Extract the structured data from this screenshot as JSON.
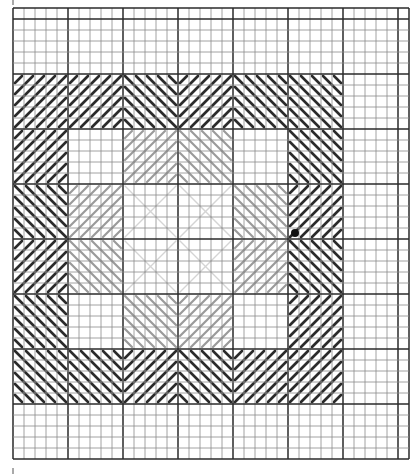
{
  "diagram": {
    "type": "needlepoint-stitch-chart",
    "grid": {
      "origin_x": 13,
      "origin_y": 8,
      "cell_size": 11,
      "cols": 36,
      "rows": 41,
      "major_every": 5,
      "major_col_offset": 0,
      "major_row_offset": 1,
      "minor_color": "#8a8a8a",
      "major_color": "#2a2a2a"
    },
    "blocks": {
      "origin_x": 13,
      "origin_y": 74,
      "block_size": 55,
      "rows": [
        [
          {
            "dir": "/",
            "tone": "dark"
          },
          {
            "dir": "/",
            "tone": "dark"
          },
          {
            "dir": "\\",
            "tone": "dark",
            "shape": "v-left"
          },
          {
            "dir": "/",
            "tone": "dark",
            "shape": "v-right"
          },
          {
            "dir": "\\",
            "tone": "dark"
          },
          {
            "dir": "\\",
            "tone": "dark"
          }
        ],
        [
          {
            "dir": "/",
            "tone": "dark"
          },
          {
            "dir": "none",
            "tone": "faint"
          },
          {
            "dir": "/",
            "tone": "light"
          },
          {
            "dir": "\\",
            "tone": "light"
          },
          {
            "dir": "none",
            "tone": "faint"
          },
          {
            "dir": "\\",
            "tone": "dark"
          }
        ],
        [
          {
            "dir": "\\",
            "tone": "dark"
          },
          {
            "dir": "/",
            "tone": "light"
          },
          {
            "dir": "x",
            "tone": "faint"
          },
          {
            "dir": "x",
            "tone": "faint"
          },
          {
            "dir": "\\",
            "tone": "light"
          },
          {
            "dir": "/",
            "tone": "dark"
          }
        ],
        [
          {
            "dir": "/",
            "tone": "dark"
          },
          {
            "dir": "\\",
            "tone": "light"
          },
          {
            "dir": "x",
            "tone": "faint"
          },
          {
            "dir": "x",
            "tone": "faint"
          },
          {
            "dir": "/",
            "tone": "light"
          },
          {
            "dir": "\\",
            "tone": "dark"
          }
        ],
        [
          {
            "dir": "\\",
            "tone": "dark"
          },
          {
            "dir": "none",
            "tone": "faint"
          },
          {
            "dir": "\\",
            "tone": "light"
          },
          {
            "dir": "/",
            "tone": "light"
          },
          {
            "dir": "none",
            "tone": "faint"
          },
          {
            "dir": "/",
            "tone": "dark"
          }
        ],
        [
          {
            "dir": "\\",
            "tone": "dark"
          },
          {
            "dir": "\\",
            "tone": "dark"
          },
          {
            "dir": "/",
            "tone": "dark"
          },
          {
            "dir": "\\",
            "tone": "dark"
          },
          {
            "dir": "/",
            "tone": "dark"
          },
          {
            "dir": "/",
            "tone": "dark"
          }
        ]
      ]
    },
    "start_dot": {
      "x": 295,
      "y": 233,
      "r": 4,
      "color": "#111111"
    },
    "tone_colors": {
      "dark": "#2b2b2b",
      "light": "#9a9a9a",
      "faint": "#d4d4d4"
    },
    "edge_ticks": [
      {
        "x": 13,
        "y1": 0,
        "y2": 5
      },
      {
        "x": 13,
        "y1": 468,
        "y2": 474
      }
    ]
  }
}
